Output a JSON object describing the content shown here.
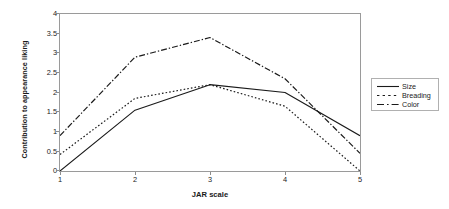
{
  "chart_data": {
    "type": "line",
    "title": "",
    "xlabel": "JAR scale",
    "ylabel": "Contribution to appearance liking",
    "x": [
      1,
      2,
      3,
      4,
      5
    ],
    "xticks": [
      "1",
      "2",
      "3",
      "4",
      "5"
    ],
    "yticks": [
      "0",
      "0.5",
      "1",
      "1.5",
      "2",
      "2.5",
      "3",
      "3.5",
      "4"
    ],
    "xlim": [
      1,
      5
    ],
    "ylim": [
      0,
      4
    ],
    "grid": false,
    "legend_position": "right-outside",
    "series": [
      {
        "name": "Size",
        "style": "solid",
        "color": "#1a1a1a",
        "values": [
          0,
          1.55,
          2.2,
          2.0,
          0.9
        ]
      },
      {
        "name": "Breading",
        "style": "dotted",
        "color": "#1a1a1a",
        "values": [
          0.42,
          1.85,
          2.2,
          1.65,
          0
        ]
      },
      {
        "name": "Color",
        "style": "dash-dot",
        "color": "#1a1a1a",
        "values": [
          0.9,
          2.9,
          3.4,
          2.35,
          0.45
        ]
      }
    ]
  },
  "legend": {
    "items": [
      {
        "label": "Size"
      },
      {
        "label": "Breading"
      },
      {
        "label": "Color"
      }
    ]
  },
  "axes": {
    "x_title": "JAR scale",
    "y_title": "Contribution to appearance liking",
    "y_labels": [
      "4",
      "3.5",
      "3",
      "2.5",
      "2",
      "1.5",
      "1",
      "0.5",
      "0"
    ],
    "x_labels": [
      "1",
      "2",
      "3",
      "4",
      "5"
    ]
  }
}
